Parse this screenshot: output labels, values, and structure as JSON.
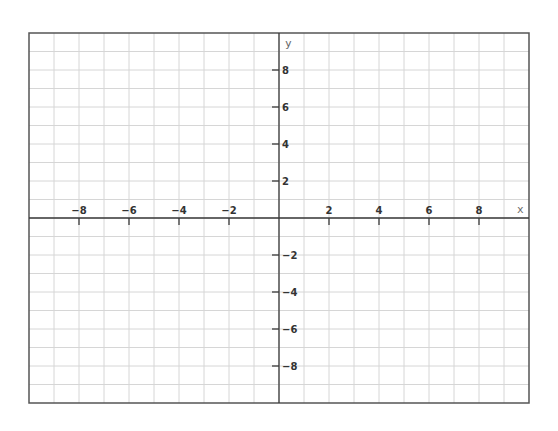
{
  "chart_data": {
    "type": "line",
    "title": "",
    "xlabel": "x",
    "ylabel": "y",
    "xlim": [
      -10,
      10
    ],
    "ylim": [
      -10,
      10
    ],
    "grid": true,
    "grid_step": 1,
    "x_ticks": [
      -8,
      -6,
      -4,
      -2,
      2,
      4,
      6,
      8
    ],
    "y_ticks": [
      8,
      6,
      4,
      2,
      -2,
      -4,
      -6,
      -8
    ],
    "x_tick_labels": [
      "−8",
      "−6",
      "−4",
      "−2",
      "2",
      "4",
      "6",
      "8"
    ],
    "y_tick_labels": [
      "8",
      "6",
      "4",
      "2",
      "−2",
      "−4",
      "−6",
      "−8"
    ],
    "series": []
  },
  "colors": {
    "grid": "#d6d6d6",
    "axis": "#3a3a3a",
    "border": "#555555"
  }
}
